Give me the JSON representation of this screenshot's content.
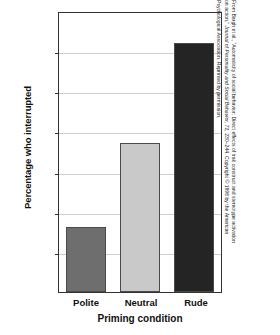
{
  "chart_data": {
    "type": "bar",
    "title": "",
    "categories": [
      "Polite",
      "Neutral",
      "Rude"
    ],
    "values": [
      16.3,
      37.4,
      62.6
    ],
    "xlabel": "Priming condition",
    "ylabel": "Percentage who interrupted",
    "ylim": [
      0,
      70
    ],
    "yticks": [
      0,
      10,
      20,
      30,
      40,
      50,
      60,
      70
    ],
    "ytick_labels": [
      "0",
      "10",
      "20",
      "30",
      "40",
      "50",
      "60",
      "70"
    ],
    "grid": true,
    "legend": "none",
    "bar_colors": [
      "#6e6e6e",
      "#c9c9c9",
      "#242424"
    ]
  },
  "axes": {
    "y_title": "Percentage who interrupted",
    "x_title": "Priming condition",
    "y_ticks": [
      {
        "label": "70",
        "value": 70
      },
      {
        "label": "60",
        "value": 60
      },
      {
        "label": "50",
        "value": 50
      },
      {
        "label": "40",
        "value": 40
      },
      {
        "label": "30",
        "value": 30
      },
      {
        "label": "20",
        "value": 20
      },
      {
        "label": "10",
        "value": 10
      },
      {
        "label": "0",
        "value": 0
      }
    ],
    "x_ticks": [
      {
        "label": "Polite"
      },
      {
        "label": "Neutral"
      },
      {
        "label": "Rude"
      }
    ]
  },
  "credit": {
    "line1_a": "From Bargh et al., “Automaticity of social behavior: Direct effects of trait construct and stereotype activation",
    "line2_a": "on action,” ",
    "line2_italic": "Journal of Personality and Social Behavior, 71,",
    "line2_b": " 230–244. Copyright © 1996 by the American",
    "line3_a": "Psychological Association. Reprinted by permission."
  }
}
